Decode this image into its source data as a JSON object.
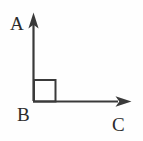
{
  "figure": {
    "background_color": "#fefefe",
    "stroke_color": "#3a3a3a",
    "label_color": "#2b2b2b",
    "stroke_width": 2,
    "vertex_label": "B",
    "ray_up_label": "A",
    "ray_right_label": "C",
    "right_angle_marker": "square",
    "labels": {
      "a": "A",
      "b": "B",
      "c": "C"
    },
    "geometry": {
      "vertex": [
        33,
        101
      ],
      "ray_up_tip": [
        33,
        13
      ],
      "ray_right_tip": [
        131,
        101
      ],
      "square_size": 22,
      "angle_degrees": 90
    }
  }
}
